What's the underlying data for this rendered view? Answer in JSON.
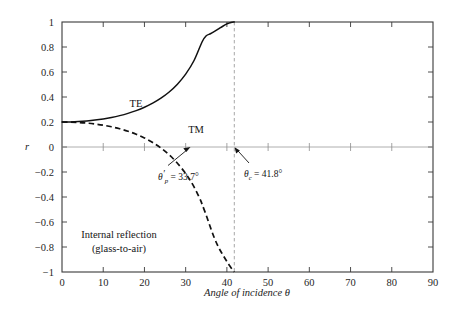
{
  "chart_data": {
    "type": "line",
    "title": "",
    "xlabel": "Angle of incidence θ",
    "ylabel": "r",
    "xlim": [
      0,
      90
    ],
    "ylim": [
      -1,
      1
    ],
    "grid": false,
    "legend_position": "inline-curve-labels",
    "x_ticks": [
      0,
      10,
      20,
      30,
      40,
      50,
      60,
      70,
      80,
      90
    ],
    "x_tick_labels": [
      "0",
      "10",
      "20",
      "30",
      "40",
      "50",
      "60",
      "70",
      "80",
      "90"
    ],
    "y_ticks": [
      -1,
      -0.8,
      -0.6,
      -0.4,
      -0.2,
      0,
      0.2,
      0.4,
      0.6,
      0.8,
      1
    ],
    "y_tick_labels": [
      "−1",
      "−0.8",
      "−0.6",
      "−0.4",
      "−0.2",
      "0",
      "0.2",
      "0.4",
      "0.6",
      "0.8",
      "1"
    ],
    "series": [
      {
        "name": "TE",
        "style": "solid",
        "label_text": "TE",
        "x": [
          0,
          2,
          4,
          6,
          8,
          10,
          12,
          14,
          16,
          18,
          20,
          22,
          24,
          26,
          28,
          30,
          32,
          34,
          35,
          36,
          37,
          38,
          39,
          40,
          40.5,
          41,
          41.3,
          41.6,
          41.8
        ],
        "y": [
          0.2,
          0.2009,
          0.2037,
          0.2085,
          0.2154,
          0.2246,
          0.2364,
          0.2511,
          0.2692,
          0.2913,
          0.3182,
          0.3509,
          0.3909,
          0.4404,
          0.5026,
          0.5827,
          0.6898,
          0.8419,
          0.8898,
          0.9058,
          0.9243,
          0.9452,
          0.9661,
          0.9845,
          0.9912,
          0.9966,
          0.9985,
          0.9996,
          1.0
        ]
      },
      {
        "name": "TM",
        "style": "dashed",
        "label_text": "TM",
        "x": [
          0,
          2,
          4,
          6,
          8,
          10,
          12,
          14,
          16,
          18,
          20,
          22,
          24,
          26,
          28,
          30,
          31,
          32,
          33,
          33.7,
          34,
          35,
          36,
          37,
          38,
          39,
          40,
          40.5,
          41,
          41.3,
          41.6,
          41.8
        ],
        "y": [
          0.2,
          0.1991,
          0.1962,
          0.1913,
          0.1841,
          0.1744,
          0.1619,
          0.1461,
          0.1265,
          0.1023,
          0.0726,
          0.0362,
          -0.0083,
          -0.0627,
          -0.1296,
          -0.2122,
          -0.2614,
          -0.3177,
          -0.3834,
          -0.4333,
          -0.4594,
          -0.5469,
          -0.6423,
          -0.7307,
          -0.8043,
          -0.8623,
          -0.9165,
          -0.9418,
          -0.9655,
          -0.978,
          -0.9895,
          -1.0
        ]
      }
    ],
    "annotations": [
      {
        "name": "brewster-angle",
        "symbol": "θ",
        "symbol_prime": "′",
        "subscript": "p",
        "equals": " = 33.7°",
        "point_x": 33.7,
        "point_y": 0
      },
      {
        "name": "critical-angle",
        "symbol": "θ",
        "symbol_prime": "",
        "subscript": "c",
        "equals": " = 41.8°",
        "point_x": 41.8,
        "point_y": 0
      }
    ],
    "vertical_reference_line": {
      "name": "critical-angle-line",
      "x": 41.8,
      "style": "dashed",
      "color": "#9e9e9e"
    },
    "caption_lines": [
      "Internal reflection",
      "(glass-to-air)"
    ],
    "colors": {
      "curve": "#111111",
      "axis": "#3a3a3a",
      "zero_line": "#9a9a9a",
      "reference_line": "#9e9e9e",
      "background": "#ffffff"
    }
  }
}
